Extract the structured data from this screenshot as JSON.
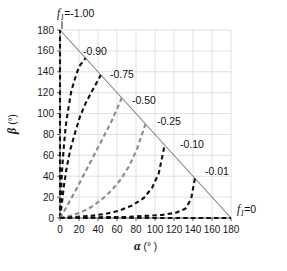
{
  "chart_data": {
    "type": "line",
    "title": "",
    "xlabel": "α (°)",
    "ylabel": "β (°)",
    "xlim": [
      0,
      180
    ],
    "ylim": [
      0,
      180
    ],
    "xticks": [
      0,
      20,
      40,
      60,
      80,
      100,
      120,
      140,
      160,
      180
    ],
    "yticks": [
      0,
      20,
      40,
      60,
      80,
      100,
      120,
      140,
      160,
      180
    ],
    "grid": true,
    "legend_position": "inline-annotations",
    "constraint_line": {
      "label": "α + β = 180",
      "from": [
        0,
        180
      ],
      "to": [
        180,
        0
      ],
      "color": "#808080",
      "style": "solid"
    },
    "series": [
      {
        "name": "f1=-1.00",
        "label": "-1.00",
        "color": "#111111",
        "style": "dashed",
        "points": [
          [
            0,
            0
          ],
          [
            0,
            20
          ],
          [
            0,
            40
          ],
          [
            0,
            60
          ],
          [
            0,
            80
          ],
          [
            0,
            100
          ],
          [
            0,
            120
          ],
          [
            0,
            140
          ],
          [
            0,
            160
          ],
          [
            0,
            180
          ]
        ]
      },
      {
        "name": "f1=-0.90",
        "label": "-0.90",
        "color": "#111111",
        "style": "dashed",
        "points": [
          [
            0,
            0
          ],
          [
            1,
            20
          ],
          [
            2,
            44
          ],
          [
            4,
            68
          ],
          [
            6,
            88
          ],
          [
            9,
            106
          ],
          [
            12,
            122
          ],
          [
            16,
            134
          ],
          [
            20,
            145
          ],
          [
            27,
            153
          ]
        ]
      },
      {
        "name": "f1=-0.75",
        "label": "-0.75",
        "color": "#111111",
        "style": "dashed",
        "points": [
          [
            0,
            0
          ],
          [
            2,
            14
          ],
          [
            4,
            30
          ],
          [
            7,
            48
          ],
          [
            11,
            66
          ],
          [
            16,
            82
          ],
          [
            21,
            97
          ],
          [
            27,
            110
          ],
          [
            34,
            122
          ],
          [
            43,
            137
          ]
        ]
      },
      {
        "name": "f1=-0.50",
        "label": "-0.50",
        "color": "#8a8a8a",
        "style": "dashed",
        "points": [
          [
            0,
            0
          ],
          [
            4,
            6
          ],
          [
            9,
            14
          ],
          [
            15,
            24
          ],
          [
            22,
            36
          ],
          [
            30,
            50
          ],
          [
            38,
            64
          ],
          [
            46,
            78
          ],
          [
            55,
            94
          ],
          [
            65,
            115
          ]
        ]
      },
      {
        "name": "f1=-0.25",
        "label": "-0.25",
        "color": "#8a8a8a",
        "style": "dashed",
        "points": [
          [
            0,
            0
          ],
          [
            10,
            2
          ],
          [
            21,
            5
          ],
          [
            32,
            10
          ],
          [
            43,
            17
          ],
          [
            54,
            26
          ],
          [
            64,
            37
          ],
          [
            73,
            50
          ],
          [
            81,
            66
          ],
          [
            90,
            90
          ]
        ]
      },
      {
        "name": "f1=-0.10",
        "label": "-0.10",
        "color": "#111111",
        "style": "dashed",
        "points": [
          [
            0,
            0
          ],
          [
            16,
            1
          ],
          [
            32,
            2
          ],
          [
            48,
            4
          ],
          [
            62,
            7
          ],
          [
            76,
            12
          ],
          [
            88,
            19
          ],
          [
            97,
            29
          ],
          [
            104,
            43
          ],
          [
            110,
            69
          ]
        ]
      },
      {
        "name": "f1=-0.01",
        "label": "-0.01",
        "color": "#111111",
        "style": "dashed",
        "points": [
          [
            0,
            0
          ],
          [
            24,
            0
          ],
          [
            48,
            1
          ],
          [
            70,
            1
          ],
          [
            90,
            2
          ],
          [
            108,
            3
          ],
          [
            122,
            5
          ],
          [
            132,
            9
          ],
          [
            138,
            18
          ],
          [
            142,
            38
          ]
        ]
      },
      {
        "name": "f1=0",
        "label": "0",
        "color": "#111111",
        "style": "dashed",
        "points": [
          [
            0,
            0
          ],
          [
            20,
            0
          ],
          [
            40,
            0
          ],
          [
            60,
            0
          ],
          [
            80,
            0
          ],
          [
            100,
            0
          ],
          [
            120,
            0
          ],
          [
            140,
            0
          ],
          [
            160,
            0
          ],
          [
            180,
            0
          ]
        ]
      }
    ],
    "annotations": [
      {
        "name": "f1-top-left",
        "text_prefix": "f",
        "text_sub": "1",
        "text_suffix": "=-1.00",
        "x": 57,
        "y": 17
      },
      {
        "name": "label-0-90",
        "text": "-0.90",
        "x": 83,
        "y": 55
      },
      {
        "name": "label-0-75",
        "text": "-0.75",
        "x": 110,
        "y": 78
      },
      {
        "name": "label-0-50",
        "text": "-0.50",
        "x": 132,
        "y": 104
      },
      {
        "name": "label-0-25",
        "text": "-0.25",
        "x": 157,
        "y": 125
      },
      {
        "name": "label-0-10",
        "text": "-0.10",
        "x": 180,
        "y": 148
      },
      {
        "name": "label-0-01",
        "text": "-0.01",
        "x": 205,
        "y": 175
      },
      {
        "name": "f1-bottom-right",
        "text_prefix": "f",
        "text_sub": "1",
        "text_suffix": "=0",
        "x": 237,
        "y": 213
      }
    ]
  },
  "axes": {
    "x_title_symbol": "α",
    "x_title_unit": "(° )",
    "y_title_symbol": "β",
    "y_title_unit": "(°)",
    "x_tick_labels": [
      "0",
      "20",
      "40",
      "60",
      "80",
      "100",
      "120",
      "140",
      "160",
      "180"
    ],
    "y_tick_labels": [
      "0",
      "20",
      "40",
      "60",
      "80",
      "100",
      "120",
      "140",
      "160",
      "180"
    ]
  },
  "colors": {
    "grid": "#d9d9d9",
    "axis": "#595959",
    "curve_dark": "#111111",
    "curve_light": "#8a8a8a",
    "constraint": "#808080",
    "text": "#111111",
    "background": "#ffffff"
  }
}
